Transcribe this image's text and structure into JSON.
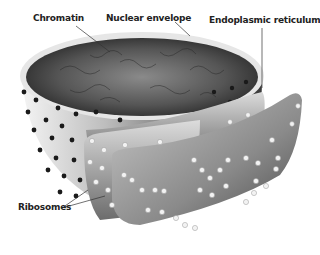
{
  "diagram": {
    "labels": {
      "chromatin": "Chromatin",
      "nuclear_envelope": "Nuclear envelope",
      "endoplasmic_reticulum": "Endoplasmic reticulum",
      "ribosomes": "Ribosomes"
    },
    "colors": {
      "background": "#ffffff",
      "chromatin_dark": "#2e2e2e",
      "chromatin_mid": "#6a6a6a",
      "envelope_light": "#e4e4e4",
      "envelope_shadow": "#8a8a8a",
      "pore": "#1a1a1a",
      "ribosome": "#f2f2f2",
      "label_text": "#222222"
    }
  }
}
